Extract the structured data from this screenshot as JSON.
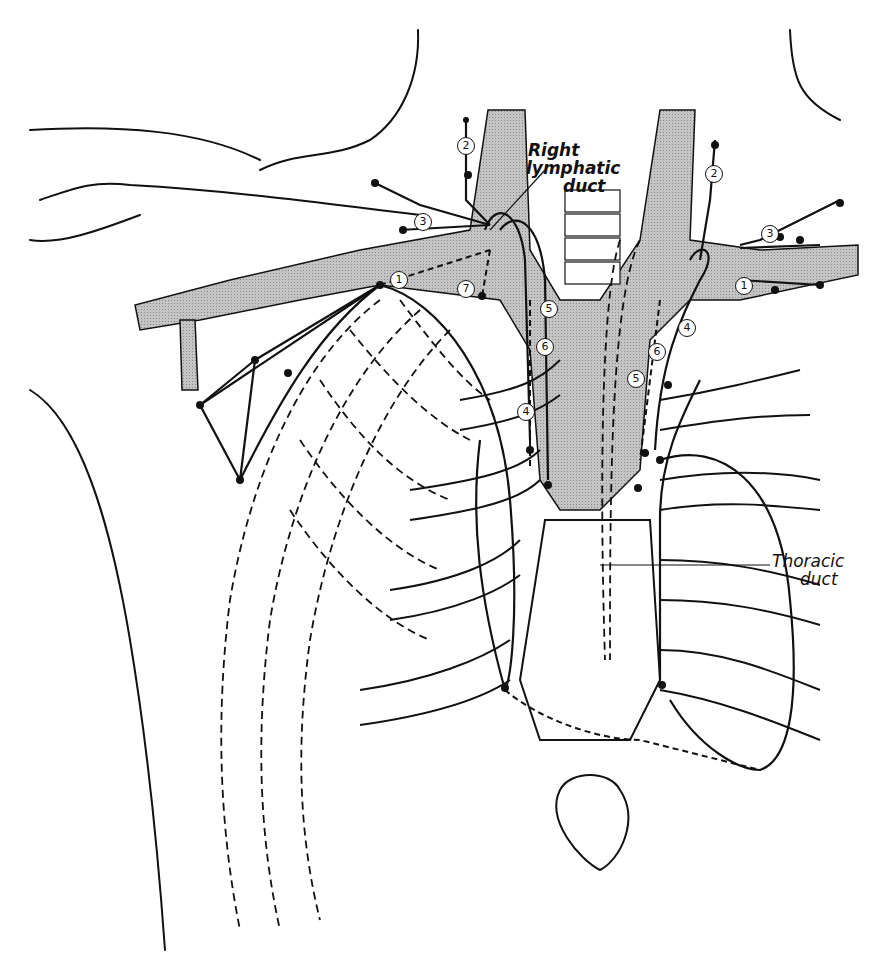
{
  "figure": {
    "labels": {
      "right_lymphatic_duct_line1": "Right",
      "right_lymphatic_duct_line2": "lymphatic",
      "right_lymphatic_duct_line3": "duct",
      "thoracic_duct_line1": "Thoracic",
      "thoracic_duct_line2": "duct"
    },
    "node_markers": {
      "left_side": [
        "1",
        "2",
        "3",
        "4",
        "5",
        "6",
        "7"
      ],
      "right_side": [
        "1",
        "2",
        "3",
        "4",
        "5",
        "6"
      ]
    },
    "colors": {
      "vessel_fill": "#b9b9b9",
      "ink": "#111111",
      "background": "#ffffff"
    }
  }
}
